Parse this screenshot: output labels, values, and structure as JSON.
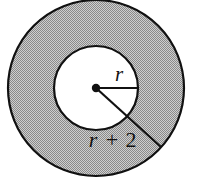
{
  "figure": {
    "name": "annulus-diagram",
    "background_color": "#ffffff",
    "outline_color": "#111111",
    "shaded_fill_color": "#a8a8a8",
    "inner_fill_color": "#ffffff",
    "labels": {
      "inner_radius": "r",
      "outer_radius_var": "r",
      "outer_radius_operator": "+",
      "outer_radius_const": "2",
      "outer_radius_full": "r + 2"
    },
    "geometry": {
      "center_x": 96,
      "center_y": 88,
      "inner_radius_px": 42,
      "outer_radius_px": 88,
      "center_dot_radius_px": 4,
      "inner_radius_line_angle_deg": 0,
      "outer_radius_line_angle_deg": 42
    }
  }
}
